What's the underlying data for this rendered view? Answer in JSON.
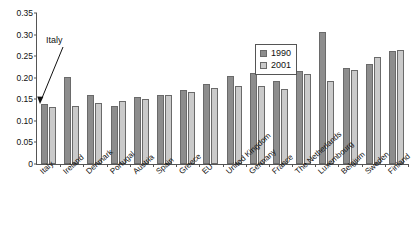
{
  "chart_data": {
    "type": "bar",
    "title": "",
    "subtitle": "",
    "xlabel": "",
    "ylabel": "",
    "ylim": [
      0,
      0.35
    ],
    "ytick_labels": [
      "0",
      "0.05",
      "0.10",
      "0.15",
      "0.20",
      "0.25",
      "0.30",
      "0.35"
    ],
    "ytick_values": [
      0,
      0.05,
      0.1,
      0.15,
      0.2,
      0.25,
      0.3,
      0.35
    ],
    "grid": false,
    "legend_position": "upper-right-inside",
    "categories": [
      "Italy",
      "Ireland",
      "Denmark",
      "Portugal",
      "Austria",
      "Spain",
      "Greece",
      "EU",
      "United Kingdom",
      "Germany",
      "France",
      "The Netherlands",
      "Luxembourg",
      "Belgium",
      "Sweden",
      "Finland"
    ],
    "series": [
      {
        "name": "1990",
        "color": "#8d8d8d",
        "values": [
          0.14,
          0.202,
          0.159,
          0.135,
          0.156,
          0.161,
          0.171,
          0.186,
          0.203,
          0.211,
          0.192,
          0.215,
          0.305,
          0.222,
          0.232,
          0.262
        ]
      },
      {
        "name": "2001",
        "color": "#cacaca",
        "values": [
          0.132,
          0.135,
          0.142,
          0.145,
          0.151,
          0.16,
          0.168,
          0.176,
          0.18,
          0.18,
          0.173,
          0.209,
          0.192,
          0.217,
          0.248,
          0.265
        ]
      }
    ],
    "annotations": [
      {
        "text": "Italy",
        "target_category": "Italy",
        "target_series": "1990"
      }
    ]
  },
  "legend": {
    "entries": [
      {
        "label": "1990"
      },
      {
        "label": "2001"
      }
    ]
  },
  "annotation": {
    "label": "Italy"
  }
}
